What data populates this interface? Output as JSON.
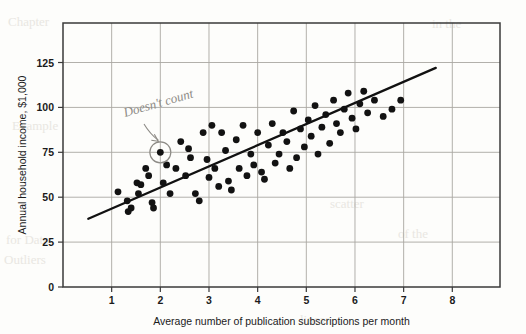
{
  "figure": {
    "annotation_text": "Doesn't count",
    "colors": {
      "point": "#121212",
      "trendline": "#111111",
      "frame": "#3a3a3a",
      "grid": "#a9a7a2",
      "pencil": "#8d8b86",
      "paper": "#fdfdfb"
    },
    "bleed_text": [
      "Chapter",
      "in the",
      "Example",
      "for Data",
      "Outliers",
      "scatter",
      "of the",
      "linear"
    ]
  },
  "chart_data": {
    "type": "scatter",
    "title": "",
    "xlabel": "Average number of publication subscriptions per month",
    "ylabel": "Annual household income, $1,000",
    "xlim": [
      0,
      8.98
    ],
    "ylim": [
      0,
      147
    ],
    "xticks": [
      1,
      2,
      3,
      4,
      5,
      6,
      7,
      8
    ],
    "yticks": [
      0,
      25,
      50,
      75,
      100,
      125
    ],
    "grid": true,
    "grid_axes": "both",
    "legend": null,
    "annotations": [
      {
        "text": "Doesn't count",
        "kind": "handwritten-pencil",
        "points_to": [
          2.0,
          75
        ],
        "marker": "circled-outlier"
      }
    ],
    "trendline": {
      "type": "linear-fit",
      "x_start": 0.52,
      "y_start": 38,
      "x_end": 7.66,
      "y_end": 122
    },
    "outlier": {
      "x": 2.0,
      "y": 75,
      "circled": true,
      "excluded": true
    },
    "points": [
      [
        1.13,
        53
      ],
      [
        1.32,
        48
      ],
      [
        1.34,
        42
      ],
      [
        1.4,
        44
      ],
      [
        1.52,
        58
      ],
      [
        1.55,
        52
      ],
      [
        1.6,
        57
      ],
      [
        1.7,
        66
      ],
      [
        1.76,
        62
      ],
      [
        1.83,
        47
      ],
      [
        1.86,
        44
      ],
      [
        2.0,
        75
      ],
      [
        2.06,
        58
      ],
      [
        2.13,
        68
      ],
      [
        2.2,
        52
      ],
      [
        2.32,
        66
      ],
      [
        2.42,
        81
      ],
      [
        2.52,
        62
      ],
      [
        2.58,
        77
      ],
      [
        2.62,
        72
      ],
      [
        2.72,
        52
      ],
      [
        2.8,
        48
      ],
      [
        2.88,
        86
      ],
      [
        2.96,
        71
      ],
      [
        3.0,
        61
      ],
      [
        3.06,
        90
      ],
      [
        3.12,
        66
      ],
      [
        3.2,
        56
      ],
      [
        3.26,
        86
      ],
      [
        3.34,
        76
      ],
      [
        3.4,
        59
      ],
      [
        3.46,
        54
      ],
      [
        3.56,
        82
      ],
      [
        3.62,
        66
      ],
      [
        3.7,
        90
      ],
      [
        3.78,
        62
      ],
      [
        3.86,
        74
      ],
      [
        3.92,
        68
      ],
      [
        4.0,
        86
      ],
      [
        4.08,
        64
      ],
      [
        4.14,
        60
      ],
      [
        4.22,
        79
      ],
      [
        4.3,
        91
      ],
      [
        4.36,
        69
      ],
      [
        4.44,
        74
      ],
      [
        4.52,
        86
      ],
      [
        4.6,
        81
      ],
      [
        4.66,
        66
      ],
      [
        4.74,
        98
      ],
      [
        4.8,
        72
      ],
      [
        4.88,
        88
      ],
      [
        4.96,
        78
      ],
      [
        5.04,
        93
      ],
      [
        5.1,
        84
      ],
      [
        5.18,
        101
      ],
      [
        5.24,
        74
      ],
      [
        5.32,
        89
      ],
      [
        5.4,
        96
      ],
      [
        5.48,
        80
      ],
      [
        5.56,
        104
      ],
      [
        5.62,
        91
      ],
      [
        5.7,
        86
      ],
      [
        5.78,
        99
      ],
      [
        5.86,
        108
      ],
      [
        5.94,
        94
      ],
      [
        6.02,
        88
      ],
      [
        6.1,
        102
      ],
      [
        6.18,
        109
      ],
      [
        6.26,
        97
      ],
      [
        6.4,
        104
      ],
      [
        6.58,
        95
      ],
      [
        6.76,
        99
      ],
      [
        6.94,
        104
      ]
    ]
  }
}
